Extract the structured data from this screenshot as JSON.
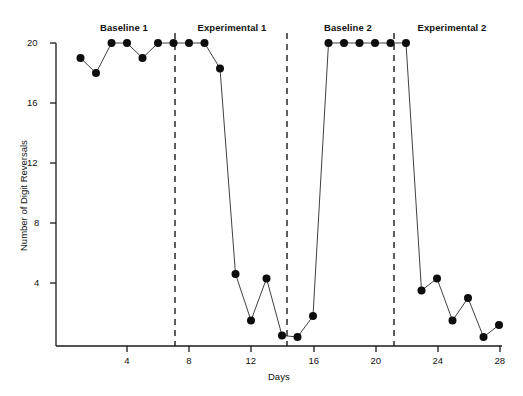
{
  "figure": {
    "title": "",
    "x_axis_title": "Days",
    "y_axis_title": "Number of Digit Reversals"
  },
  "phases": [
    {
      "name": "baseline-1",
      "label": "Baseline 1",
      "x_center": 124,
      "y": 22
    },
    {
      "name": "experimental-1",
      "label": "Experimental 1",
      "x_center": 232,
      "y": 22
    },
    {
      "name": "baseline-2",
      "label": "Baseline 2",
      "x_center": 348,
      "y": 22
    },
    {
      "name": "experimental-2",
      "label": "Experimental 2",
      "x_center": 452,
      "y": 22
    }
  ],
  "axes": {
    "x_ticks": [
      {
        "label": "4",
        "value": 4,
        "px": 127
      },
      {
        "label": "8",
        "value": 8,
        "px": 189
      },
      {
        "label": "12",
        "value": 12,
        "px": 251
      },
      {
        "label": "16",
        "value": 16,
        "px": 314
      },
      {
        "label": "20",
        "value": 20,
        "px": 376
      },
      {
        "label": "24",
        "value": 24,
        "px": 438
      },
      {
        "label": "28",
        "value": 28,
        "px": 500
      }
    ],
    "y_ticks": [
      {
        "label": "20",
        "value": 20,
        "px": 43
      },
      {
        "label": "16",
        "value": 16,
        "px": 103
      },
      {
        "label": "12",
        "value": 12,
        "px": 163
      },
      {
        "label": "8",
        "value": 8,
        "px": 223
      },
      {
        "label": "4",
        "value": 4,
        "px": 283
      }
    ]
  },
  "phase_dividers": [
    {
      "name": "divider-baseline1-experimental1",
      "x": 175
    },
    {
      "name": "divider-experimental1-baseline2",
      "x": 287
    },
    {
      "name": "divider-baseline2-experimental2",
      "x": 394
    }
  ],
  "caption_partial": "",
  "chart_data": {
    "type": "line",
    "title": "",
    "xlabel": "Days",
    "ylabel": "Number of Digit Reversals",
    "xlim": [
      0.2,
      28.6
    ],
    "ylim": [
      0,
      20.6
    ],
    "grid": false,
    "legend": "none",
    "marker": "filled-circle",
    "x": [
      1,
      2,
      3,
      4,
      5,
      6,
      7,
      8,
      9,
      10,
      11,
      12,
      13,
      14,
      15,
      16,
      17,
      18,
      19,
      20,
      21,
      22,
      23,
      24,
      25,
      26,
      27,
      28
    ],
    "values": [
      19.0,
      18.0,
      20.0,
      20.0,
      19.0,
      20.0,
      20.0,
      20.0,
      20.0,
      18.3,
      4.6,
      1.5,
      4.3,
      0.5,
      0.4,
      1.8,
      20.0,
      20.0,
      20.0,
      20.0,
      20.0,
      20.0,
      3.5,
      4.3,
      1.5,
      3.0,
      0.4,
      1.2
    ],
    "phase_segments": [
      {
        "label": "Baseline 1",
        "days": [
          1,
          7
        ],
        "values": [
          19.0,
          18.0,
          20.0,
          20.0,
          19.0,
          20.0,
          20.0
        ]
      },
      {
        "label": "Experimental 1",
        "days": [
          8,
          14
        ],
        "values": [
          20.0,
          20.0,
          18.3,
          4.6,
          1.5,
          4.3,
          0.5
        ]
      },
      {
        "label": "Baseline 2",
        "days": [
          15,
          21
        ],
        "values": [
          0.4,
          1.8,
          20.0,
          20.0,
          20.0,
          20.0,
          20.0
        ]
      },
      {
        "label": "Experimental 2",
        "days": [
          22,
          28
        ],
        "values": [
          20.0,
          3.5,
          4.3,
          1.5,
          3.0,
          0.4,
          1.2
        ]
      }
    ],
    "phase_divider_days": [
      7.5,
      14.5,
      21.5
    ]
  }
}
